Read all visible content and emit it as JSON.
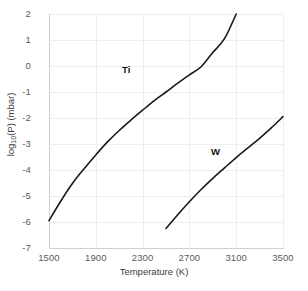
{
  "chart_data": {
    "type": "line",
    "title": "",
    "xlabel": "Temperature (K)",
    "ylabel": "log10(P) (mbar)",
    "ylabel_prefix": "log",
    "ylabel_sub": "10",
    "ylabel_suffix": "(P) (mbar)",
    "xlim": [
      1500,
      3500
    ],
    "ylim": [
      -7,
      2
    ],
    "xticks": [
      1500,
      1900,
      2300,
      2700,
      3100,
      3500
    ],
    "yticks": [
      2,
      1,
      0,
      -1,
      -2,
      -3,
      -4,
      -5,
      -6,
      -7
    ],
    "xtick_labels": [
      "1500",
      "1900",
      "2300",
      "2700",
      "3100",
      "3500"
    ],
    "ytick_labels": [
      "2",
      "1",
      "0",
      "-1",
      "-2",
      "-3",
      "-4",
      "-5",
      "-6",
      "-7"
    ],
    "grid": true,
    "legend_position": "inline-annotation",
    "line_color": "#1a1a1a",
    "grid_color": "#ededf2",
    "axis_color": "#d0d0d4",
    "tick_text_color": "#5a5a5a",
    "series": [
      {
        "name": "Ti",
        "label": "Ti",
        "label_x": 2150,
        "label_y": -0.05,
        "x": [
          1500,
          1600,
          1700,
          1800,
          1900,
          2000,
          2100,
          2200,
          2300,
          2400,
          2500,
          2600,
          2700,
          2800,
          2900,
          3000,
          3100
        ],
        "y": [
          -5.95,
          -5.2,
          -4.52,
          -3.95,
          -3.42,
          -2.92,
          -2.48,
          -2.08,
          -1.7,
          -1.33,
          -1.0,
          -0.66,
          -0.34,
          -0.03,
          0.52,
          1.05,
          2.0
        ]
      },
      {
        "name": "W",
        "label": "W",
        "label_x": 2885,
        "label_y": -3.45,
        "x": [
          2500,
          2600,
          2700,
          2800,
          2900,
          3000,
          3100,
          3200,
          3300,
          3400,
          3500
        ],
        "y": [
          -6.25,
          -5.72,
          -5.22,
          -4.75,
          -4.32,
          -3.92,
          -3.52,
          -3.15,
          -2.78,
          -2.38,
          -1.95
        ]
      }
    ]
  }
}
